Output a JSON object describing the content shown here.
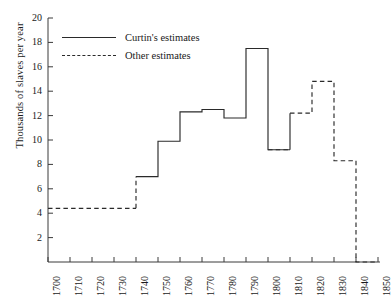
{
  "chart_data": {
    "type": "line",
    "subtype": "step",
    "title": "",
    "xlabel": "",
    "ylabel": "Thousands of slaves per year",
    "xlim": [
      1700,
      1850
    ],
    "ylim": [
      0,
      20
    ],
    "xticks": [
      1700,
      1710,
      1720,
      1730,
      1740,
      1750,
      1760,
      1770,
      1780,
      1790,
      1800,
      1810,
      1820,
      1830,
      1840,
      1850
    ],
    "xtick_labels": [
      "1700",
      "1710",
      "1720",
      "1730",
      "1740",
      "1750",
      "1760",
      "1770",
      "1780",
      "1790",
      "1800",
      "1810",
      "1820",
      "1830",
      "1840",
      "1850"
    ],
    "yticks": [
      2,
      4,
      6,
      8,
      10,
      12,
      14,
      16,
      18,
      20
    ],
    "ytick_labels": [
      "2",
      "4",
      "6",
      "8",
      "10",
      "12",
      "14",
      "16",
      "18",
      "20"
    ],
    "grid": false,
    "legend_position": "upper left",
    "series": [
      {
        "name": "Curtin's estimates",
        "style": "solid",
        "color": "#2a2a2a",
        "steps": [
          {
            "x_start": 1740,
            "x_end": 1750,
            "value": 7.0
          },
          {
            "x_start": 1750,
            "x_end": 1760,
            "value": 9.9
          },
          {
            "x_start": 1760,
            "x_end": 1770,
            "value": 12.3
          },
          {
            "x_start": 1770,
            "x_end": 1780,
            "value": 12.5
          },
          {
            "x_start": 1780,
            "x_end": 1790,
            "value": 11.8
          },
          {
            "x_start": 1790,
            "x_end": 1800,
            "value": 17.5
          },
          {
            "x_start": 1800,
            "x_end": 1810,
            "value": 9.2
          }
        ]
      },
      {
        "name": "Other estimates",
        "style": "dashed",
        "color": "#2a2a2a",
        "steps": [
          {
            "x_start": 1700,
            "x_end": 1740,
            "value": 4.4
          },
          {
            "x_start": 1810,
            "x_end": 1820,
            "value": 12.2
          },
          {
            "x_start": 1820,
            "x_end": 1830,
            "value": 14.8
          },
          {
            "x_start": 1830,
            "x_end": 1840,
            "value": 8.3
          },
          {
            "x_start": 1840,
            "x_end": 1850,
            "value": 0.0
          }
        ]
      }
    ]
  },
  "legend": {
    "items": [
      {
        "label": "Curtin's estimates",
        "style": "solid"
      },
      {
        "label": "Other estimates",
        "style": "dashed"
      }
    ]
  },
  "axes": {
    "y_title": "Thousands of slaves per year"
  }
}
